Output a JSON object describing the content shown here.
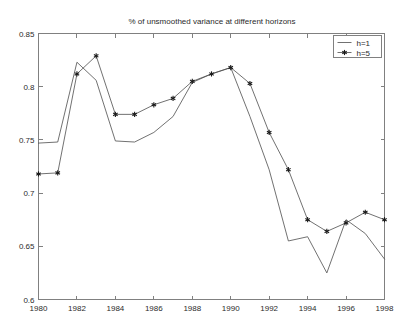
{
  "chart_data": {
    "type": "line",
    "title": "% of unsmoothed variance at different horizons",
    "xlabel": "",
    "ylabel": "",
    "xlim": [
      1980,
      1998
    ],
    "ylim": [
      0.6,
      0.85
    ],
    "xticks": [
      1980,
      1982,
      1984,
      1986,
      1988,
      1990,
      1992,
      1994,
      1996,
      1998
    ],
    "xtick_labels": [
      "1980",
      "1982",
      "1984",
      "1986",
      "1988",
      "1990",
      "1992",
      "1994",
      "1996",
      "1998"
    ],
    "yticks": [
      0.6,
      0.65,
      0.7,
      0.75,
      0.8,
      0.85
    ],
    "ytick_labels": [
      "0.6",
      "0.65",
      "0.7",
      "0.75",
      "0.8",
      "0.85"
    ],
    "grid": false,
    "legend_position": "top-right",
    "x": [
      1980,
      1981,
      1982,
      1983,
      1984,
      1985,
      1986,
      1987,
      1988,
      1989,
      1990,
      1991,
      1992,
      1993,
      1994,
      1995,
      1996,
      1997,
      1998
    ],
    "series": [
      {
        "name": "h=1",
        "marker": "none",
        "values": [
          0.747,
          0.748,
          0.823,
          0.806,
          0.749,
          0.748,
          0.757,
          0.772,
          0.804,
          0.812,
          0.818,
          0.772,
          0.722,
          0.655,
          0.659,
          0.625,
          0.675,
          0.662,
          0.638
        ]
      },
      {
        "name": "h=5",
        "marker": "star",
        "values": [
          0.718,
          0.719,
          0.812,
          0.829,
          0.774,
          0.774,
          0.783,
          0.789,
          0.805,
          0.812,
          0.818,
          0.803,
          0.757,
          0.722,
          0.675,
          0.664,
          0.672,
          0.682,
          0.675
        ]
      }
    ]
  },
  "legend": {
    "entries": [
      {
        "label": "h=1"
      },
      {
        "label": "h=5"
      }
    ]
  }
}
